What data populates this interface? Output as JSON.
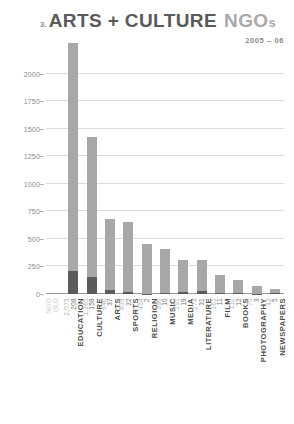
{
  "header": {
    "index": "3.",
    "title_main": "ARTS + CULTURE",
    "title_tail": "NGO",
    "title_tail_small": "s",
    "subtitle": "2005 – 06"
  },
  "legend": {
    "old_label": "OLD",
    "ngo_label": "NGO"
  },
  "colors": {
    "ngo_bar": "#a8a8a8",
    "old_bar": "#5b5b5b",
    "grid": "#dcdcdc",
    "axis": "#9a9a9a",
    "title_main": "#5a5a5a",
    "title_tail": "#a9a9a9"
  },
  "chart_data": {
    "type": "bar",
    "title": "3. ARTS + CULTURE NGOs",
    "subtitle": "2005 – 06",
    "xlabel": "",
    "ylabel": "",
    "ylim": [
      0,
      2250
    ],
    "yticks": [
      0,
      250,
      500,
      750,
      1000,
      1250,
      1500,
      1750,
      2000
    ],
    "ytick_labels": [
      "0",
      "250",
      "500",
      "750",
      "1000",
      "1250",
      "1500",
      "1750",
      "2000"
    ],
    "grid": true,
    "legend_position": "bottom-left",
    "stacked": true,
    "categories": [
      "EDUCATION",
      "CULTURE",
      "ARTS",
      "SPORTS",
      "RELIGION",
      "MUSIC",
      "MEDIA",
      "LITERATURE",
      "FILM",
      "BOOKS",
      "PHOTOGRAPHY",
      "NEWSPAPERS"
    ],
    "series": [
      {
        "name": "OLD",
        "color": "#5b5b5b",
        "values": [
          208,
          158,
          37,
          22,
          2,
          10,
          19,
          31,
          11,
          12,
          3,
          5
        ],
        "labels": [
          "208",
          "158",
          "37",
          "22",
          "2",
          "10",
          "19",
          "31",
          "11",
          "12",
          "3",
          "5"
        ]
      },
      {
        "name": "NGO",
        "color": "#a8a8a8",
        "values": [
          2073,
          1265,
          646,
          633,
          454,
          396,
          291,
          274,
          161,
          112,
          70,
          42
        ],
        "labels": [
          "2,073",
          "1,265",
          "646",
          "633",
          "454",
          "396",
          "291",
          "274",
          "161",
          "112",
          "70",
          "42"
        ]
      }
    ],
    "totals": [
      2281,
      1423,
      683,
      655,
      456,
      406,
      310,
      305,
      172,
      124,
      73,
      47
    ]
  }
}
